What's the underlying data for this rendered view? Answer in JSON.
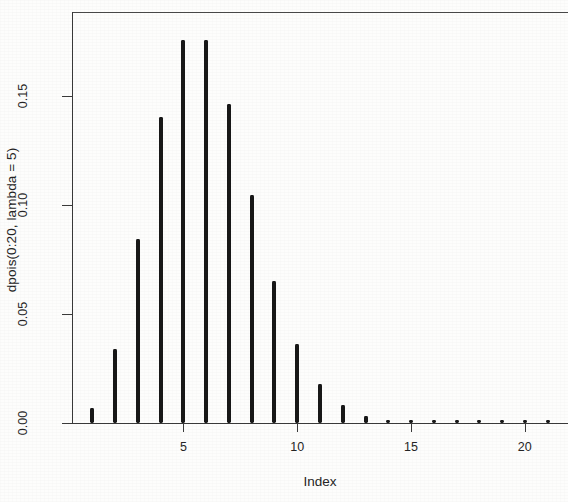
{
  "chart_data": {
    "type": "bar",
    "plot_style": "histogram-spikes (R type=\"h\")",
    "title": "",
    "xlabel": "Index",
    "ylabel": "dpois(0:20, lambda = 5)",
    "grid": false,
    "legend": null,
    "xlim": [
      0.1,
      21.9
    ],
    "ylim": [
      0.0,
      0.1884
    ],
    "x_ticks": [
      5,
      10,
      15,
      20
    ],
    "x_tick_labels": [
      "5",
      "10",
      "15",
      "20"
    ],
    "y_ticks": [
      0.0,
      0.05,
      0.1,
      0.15
    ],
    "y_tick_labels": [
      "0.00",
      "0.05",
      "0.10",
      "0.15"
    ],
    "x": [
      1,
      2,
      3,
      4,
      5,
      6,
      7,
      8,
      9,
      10,
      11,
      12,
      13,
      14,
      15,
      16,
      17,
      18,
      19,
      20,
      21
    ],
    "categories": [
      "1",
      "2",
      "3",
      "4",
      "5",
      "6",
      "7",
      "8",
      "9",
      "10",
      "11",
      "12",
      "13",
      "14",
      "15",
      "16",
      "17",
      "18",
      "19",
      "20",
      "21"
    ],
    "values": [
      0.0067,
      0.0337,
      0.0842,
      0.1404,
      0.1755,
      0.1755,
      0.1462,
      0.1044,
      0.0653,
      0.0363,
      0.0181,
      0.0082,
      0.0034,
      0.0013,
      0.0005,
      0.0002,
      0.0001,
      0.0,
      0.0,
      0.0,
      0.0
    ],
    "bar_color": "#181818",
    "axis_color": "#3a3a3a",
    "background_color": "#fdfdfc"
  },
  "axes": {
    "x_title": "Index",
    "y_title": "dpois(0:20, lambda = 5)"
  }
}
